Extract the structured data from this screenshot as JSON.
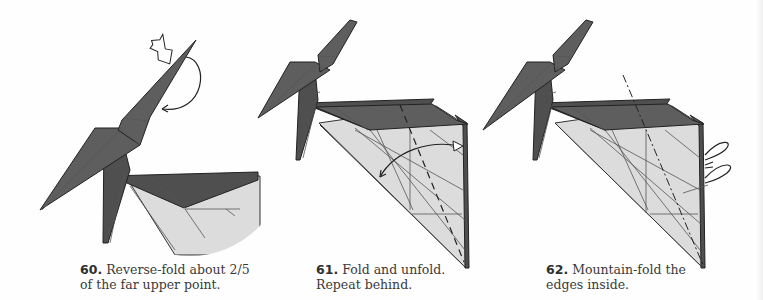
{
  "steps": [
    {
      "number": "60.",
      "line1": "Reverse-fold about 2/5",
      "line2": "of the far upper point.",
      "icons": [
        "reverse-fold-push-arrow-icon",
        "fold-arc-arrow-icon"
      ]
    },
    {
      "number": "61.",
      "line1": "Fold and unfold.",
      "line2": "Repeat behind.",
      "icons": [
        "fold-unfold-double-arrow-icon",
        "valley-fold-line-icon"
      ]
    },
    {
      "number": "62.",
      "line1": "Mountain-fold the",
      "line2": "edges inside.",
      "icons": [
        "mountain-fold-line-icon",
        "tuck-inside-arrow-icon"
      ]
    }
  ],
  "colors": {
    "paper_dark": "#5e5e5e",
    "paper_light": "#dcdcdc",
    "line": "#222222",
    "text": "#3a3a3a",
    "background": "#fefefe"
  }
}
